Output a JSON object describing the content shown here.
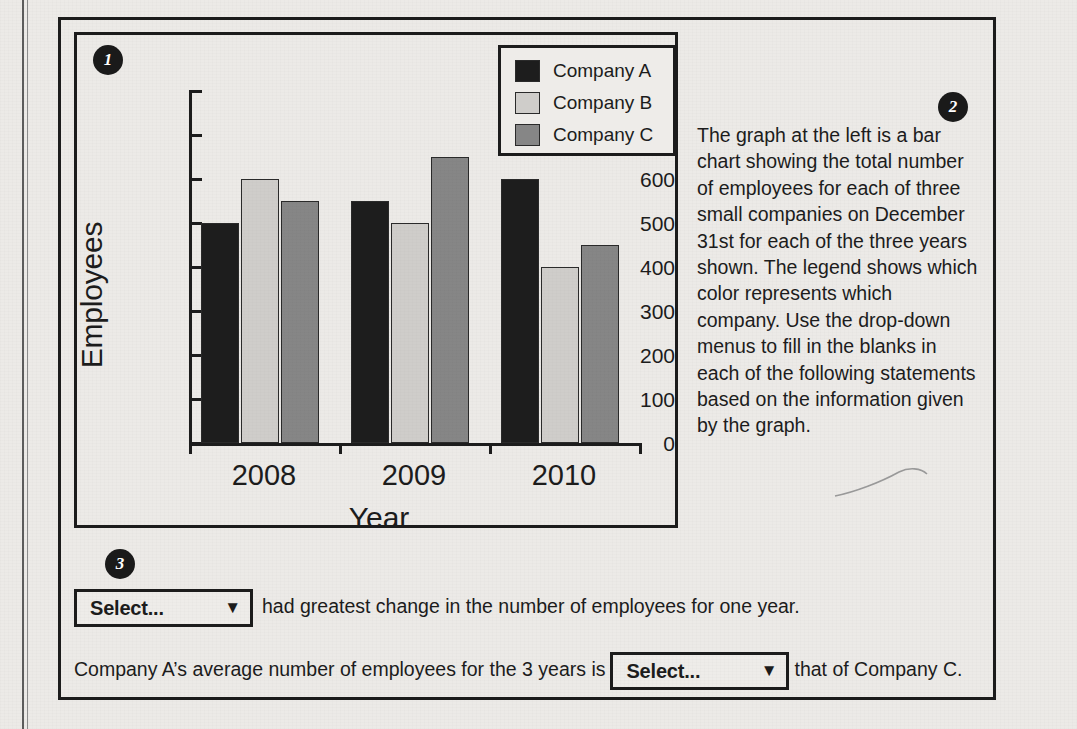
{
  "badges": {
    "one": "1",
    "two": "2",
    "three": "3"
  },
  "chart_data": {
    "type": "bar",
    "title": "",
    "xlabel": "Year",
    "ylabel": "Employees",
    "categories": [
      "2008",
      "2009",
      "2010"
    ],
    "series": [
      {
        "name": "Company A",
        "values": [
          500,
          550,
          600
        ],
        "color": "#1d1d1d"
      },
      {
        "name": "Company B",
        "values": [
          600,
          500,
          400
        ],
        "color": "#cfcdca"
      },
      {
        "name": "Company C",
        "values": [
          550,
          650,
          450
        ],
        "color": "#868686"
      }
    ],
    "ylim": [
      0,
      800
    ],
    "yticks": [
      0,
      100,
      200,
      300,
      400,
      500,
      600,
      700,
      800
    ],
    "ytick_labels": [
      "0",
      "100",
      "200",
      "300",
      "400",
      "500",
      "600",
      "700",
      "800"
    ],
    "grid": false,
    "legend_position": "top-right",
    "legend_entries": [
      "Company A",
      "Company B",
      "Company C"
    ]
  },
  "description": {
    "text": "The graph at the left is a bar chart showing the total number of employees for each of three small companies on December 31st for each of the three years shown. The legend shows which color represents which company. Use the drop-down menus to fill in the blanks in each of the following statements based on the information given by the graph."
  },
  "statements": {
    "first": {
      "dropdown_value": "Select...",
      "dropdown_caret": "▼",
      "text_after": "had greatest change in the number of employees for one year."
    },
    "second": {
      "text_before": "Company A’s average number of employees for the 3 years is",
      "dropdown_value": "Select...",
      "dropdown_caret": "▼",
      "text_after": "that of Company C."
    }
  },
  "colors": {
    "ink": "#1c1c1c",
    "paper": "#eceae7",
    "company_a": "#1d1d1d",
    "company_b": "#cfcdca",
    "company_c": "#868686"
  }
}
